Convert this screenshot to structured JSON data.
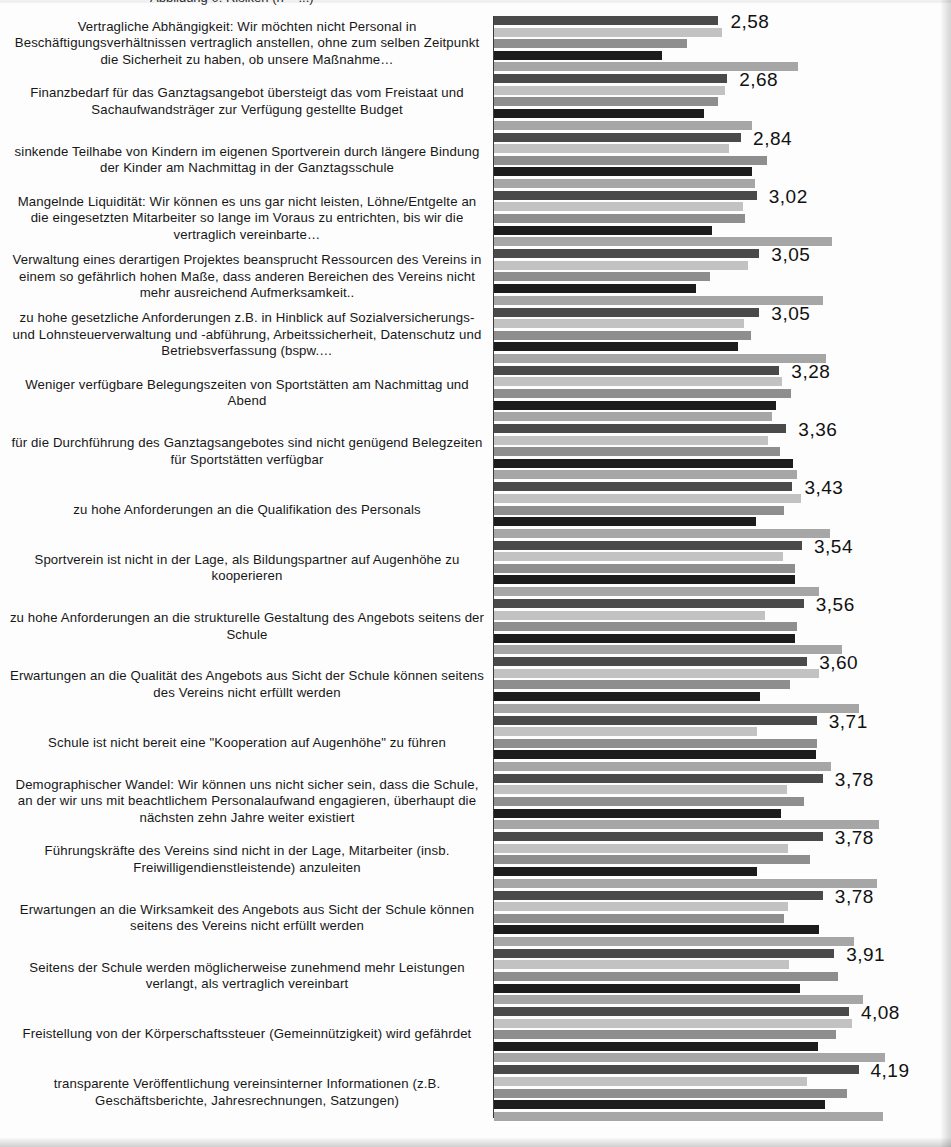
{
  "figure": {
    "top_caption_fragment": "Abbildung 0: Risiken (n = ...)",
    "axis_line_color": "#3b3b3b",
    "background": "#fdfdfd",
    "value_label_decimal_separator": ","
  },
  "series_colors": [
    "#4a4a4a",
    "#c2c2c2",
    "#8e8e8e",
    "#1c1c1c",
    "#a6a6a6"
  ],
  "chart_data": {
    "type": "bar",
    "orientation": "horizontal",
    "title": "",
    "subtitle": "",
    "xlabel": "",
    "ylabel": "",
    "xlim": [
      0,
      5
    ],
    "grid": false,
    "legend": "none",
    "value_labels_shown_for_series": 0,
    "value_label_format": "0,00",
    "series": [
      {
        "name": "Serie 1",
        "color": "#4a4a4a",
        "values": [
          2.58,
          2.68,
          2.84,
          3.02,
          3.05,
          3.05,
          3.28,
          3.36,
          3.43,
          3.54,
          3.56,
          3.6,
          3.71,
          3.78,
          3.78,
          3.78,
          3.91,
          4.08,
          4.19
        ]
      },
      {
        "name": "Serie 2",
        "color": "#c2c2c2",
        "values": [
          2.62,
          2.66,
          2.7,
          2.86,
          2.92,
          2.87,
          3.31,
          3.15,
          3.53,
          3.32,
          3.12,
          3.73,
          3.02,
          3.37,
          3.38,
          3.38,
          3.39,
          4.12,
          3.6
        ]
      },
      {
        "name": "Serie 3",
        "color": "#8e8e8e",
        "values": [
          2.22,
          2.58,
          3.14,
          2.88,
          2.48,
          2.95,
          3.41,
          3.29,
          3.33,
          3.46,
          3.48,
          3.4,
          3.71,
          3.56,
          3.63,
          3.33,
          3.95,
          3.93,
          4.06
        ]
      },
      {
        "name": "Serie 4",
        "color": "#1c1c1c",
        "values": [
          1.93,
          2.41,
          2.96,
          2.51,
          2.32,
          2.81,
          3.24,
          3.44,
          3.01,
          3.46,
          3.46,
          3.06,
          3.7,
          3.3,
          3.02,
          3.74,
          3.52,
          3.72,
          3.8
        ]
      },
      {
        "name": "Serie 5",
        "color": "#a6a6a6",
        "values": [
          3.49,
          2.97,
          3.0,
          3.89,
          3.78,
          3.82,
          3.19,
          3.48,
          3.86,
          3.74,
          4.0,
          4.2,
          3.87,
          4.43,
          4.4,
          4.14,
          4.24,
          4.49,
          4.47
        ]
      }
    ],
    "categories": [
      "Vertragliche Abhängigkeit: Wir möchten nicht Personal in Beschäftigungsverhältnissen vertraglich anstellen, ohne zum selben Zeitpunkt die Sicherheit zu haben, ob unsere Maßnahme…",
      "Finanzbedarf für das Ganztagsangebot übersteigt das vom Freistaat und Sachaufwandsträger zur Verfügung gestellte Budget",
      "sinkende Teilhabe von Kindern im eigenen Sportverein durch längere Bindung der Kinder am Nachmittag in der Ganztagsschule",
      "Mangelnde Liquidität: Wir können es uns gar nicht leisten, Löhne/Entgelte an die eingesetzten Mitarbeiter so lange im Voraus zu entrichten, bis wir die vertraglich vereinbarte…",
      "Verwaltung eines derartigen Projektes beansprucht Ressourcen des Vereins in einem so gefährlich hohen Maße, dass anderen Bereichen des Vereins nicht mehr ausreichend Aufmerksamkeit..",
      "zu hohe gesetzliche Anforderungen z.B. in Hinblick auf Sozialversicherungs- und Lohnsteuerverwaltung und -abführung, Arbeitssicherheit, Datenschutz und Betriebsverfassung (bspw.…",
      "Weniger verfügbare Belegungszeiten von Sportstätten am Nachmittag und Abend",
      "für die Durchführung des Ganztagsangebotes sind nicht genügend Belegzeiten für Sportstätten verfügbar",
      "zu hohe Anforderungen an die Qualifikation des Personals",
      "Sportverein ist nicht in der Lage, als Bildungspartner auf Augenhöhe zu kooperieren",
      "zu hohe Anforderungen an die strukturelle Gestaltung des Angebots seitens der Schule",
      "Erwartungen an die Qualität des Angebots aus Sicht der Schule können seitens des Vereins nicht erfüllt werden",
      "Schule ist nicht bereit eine \"Kooperation auf Augenhöhe\" zu führen",
      "Demographischer Wandel: Wir können uns nicht sicher sein, dass die Schule, an der wir uns mit beachtlichem Personalaufwand engagieren, überhaupt die nächsten zehn Jahre weiter existiert",
      "Führungskräfte des Vereins sind nicht in der Lage, Mitarbeiter (insb. Freiwilligendienstleistende) anzuleiten",
      "Erwartungen an die Wirksamkeit des Angebots aus Sicht der Schule können seitens des Vereins nicht erfüllt werden",
      "Seitens der Schule werden möglicherweise zunehmend mehr Leistungen verlangt, als vertraglich vereinbart",
      "Freistellung von der Körperschaftssteuer (Gemeinnützigkeit) wird gefährdet",
      "transparente Veröffentlichung vereinsinterner Informationen (z.B. Geschäftsberichte, Jahresrechnungen, Satzungen)"
    ],
    "value_labels": [
      "2,58",
      "2,68",
      "2,84",
      "3,02",
      "3,05",
      "3,05",
      "3,28",
      "3,36",
      "3,43",
      "3,54",
      "3,56",
      "3,60",
      "3,71",
      "3,78",
      "3,78",
      "3,78",
      "3,91",
      "4,08",
      "4,19"
    ]
  }
}
